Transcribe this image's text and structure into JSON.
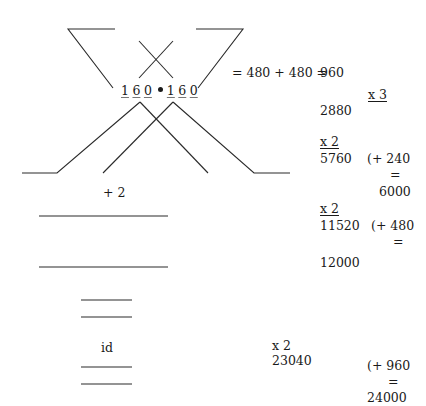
{
  "diagram": {
    "multiplication": {
      "left_digits": [
        "1",
        "6",
        "0"
      ],
      "operator": "•",
      "right_digits": [
        "1",
        "6",
        "0"
      ]
    },
    "equation": "= 480 + 480 =",
    "result_960": "960",
    "left_notes": {
      "plus_two": "+ 2",
      "id_label": "id"
    },
    "steps": [
      {
        "multiplier": "x 3",
        "value": "2880"
      },
      {
        "multiplier": "x 2",
        "value": "5760",
        "addend": "(+ 240",
        "equals": "=",
        "total": "6000"
      },
      {
        "multiplier": "x 2",
        "value": "11520",
        "addend": "(+ 480",
        "equals": "=",
        "total": "12000"
      },
      {
        "multiplier": "x 2",
        "value": "23040",
        "addend": "(+ 960",
        "equals": "=",
        "total": "24000"
      }
    ],
    "colors": {
      "ink": "#1a1a1a",
      "line": "#2a2a2a",
      "background": "#ffffff"
    }
  }
}
